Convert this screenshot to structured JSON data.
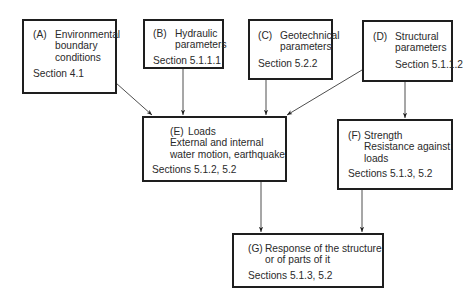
{
  "diagram": {
    "nodes": [
      {
        "id": "A",
        "letter": "(A)",
        "lines": [
          "Environmental",
          "boundary",
          "conditions"
        ],
        "section": "Section 4.1"
      },
      {
        "id": "B",
        "letter": "(B)",
        "lines": [
          "Hydraulic",
          "parameters"
        ],
        "section": "Section 5.1.1.1"
      },
      {
        "id": "C",
        "letter": "(C)",
        "lines": [
          "Geotechnical",
          "parameters"
        ],
        "section": "Section 5.2.2"
      },
      {
        "id": "D",
        "letter": "(D)",
        "lines": [
          "Structural",
          "parameters"
        ],
        "section": "Section 5.1.1.2"
      },
      {
        "id": "E",
        "letter": "(E)",
        "lines": [
          "Loads",
          "External and internal",
          "water motion, earthquake"
        ],
        "section": "Sections 5.1.2, 5.2"
      },
      {
        "id": "F",
        "letter": "(F)",
        "lines": [
          "Strength",
          "Resistance against",
          "loads"
        ],
        "section": "Sections 5.1.3, 5.2"
      },
      {
        "id": "G",
        "letter": "(G)",
        "lines": [
          "Response of the structure",
          "or of parts of it"
        ],
        "section": "Sections 5.1.3, 5.2"
      }
    ],
    "edges": [
      {
        "from": "A",
        "to": "E"
      },
      {
        "from": "B",
        "to": "E"
      },
      {
        "from": "C",
        "to": "E"
      },
      {
        "from": "D",
        "to": "E"
      },
      {
        "from": "D",
        "to": "F"
      },
      {
        "from": "E",
        "to": "G"
      },
      {
        "from": "F",
        "to": "G"
      }
    ],
    "colors": {
      "stroke": "#1e1e1e",
      "text": "#2a2a2a",
      "background": "#ffffff"
    }
  }
}
